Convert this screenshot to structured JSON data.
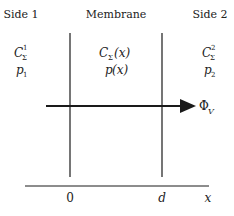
{
  "headers": {
    "side1": "Side 1",
    "membrane": "Membrane",
    "side2": "Side 2"
  },
  "side1": {
    "concentration": {
      "base": "C",
      "sub": "Σ",
      "sup": "1"
    },
    "pressure": {
      "base": "p",
      "sub": "1"
    }
  },
  "membrane": {
    "concentration": {
      "base": "C",
      "sub": "Σ",
      "arg": "(x)"
    },
    "pressure": {
      "base": "p",
      "arg": "(x)"
    }
  },
  "side2": {
    "concentration": {
      "base": "C",
      "sub": "Σ",
      "sup": "2"
    },
    "pressure": {
      "base": "p",
      "sub": "2"
    }
  },
  "flux": {
    "symbol": "Φ",
    "sub": "V"
  },
  "axis": {
    "label": "x",
    "ticks": [
      "0",
      "d"
    ]
  },
  "colors": {
    "line": "#1a1a1a",
    "background": "#ffffff"
  }
}
